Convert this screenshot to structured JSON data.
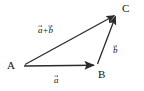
{
  "figure": {
    "type": "vector-addition-triangle",
    "background_color": "#ffffff",
    "stroke_color": "#2b2b2b",
    "text_color": "#111111",
    "points": [
      {
        "id": "A",
        "label": "A",
        "x": 23,
        "y": 66
      },
      {
        "id": "B",
        "label": "B",
        "x": 97,
        "y": 65
      },
      {
        "id": "C",
        "label": "C",
        "x": 117,
        "y": 13
      }
    ],
    "vectors": [
      {
        "id": "a",
        "label": "a",
        "from": "A",
        "to": "B",
        "arrow": true
      },
      {
        "id": "b",
        "label": "b",
        "from": "B",
        "to": "C",
        "arrow": true
      },
      {
        "id": "a_plus_b",
        "label_first": "a",
        "label_op": "+",
        "label_second": "b",
        "from": "A",
        "to": "C",
        "arrow": true
      }
    ],
    "labels": {
      "point_a": "A",
      "point_b": "B",
      "point_c": "C",
      "vector_a": "a",
      "vector_b": "b",
      "sum_first": "a",
      "sum_operator": "+",
      "sum_second": "b"
    }
  }
}
